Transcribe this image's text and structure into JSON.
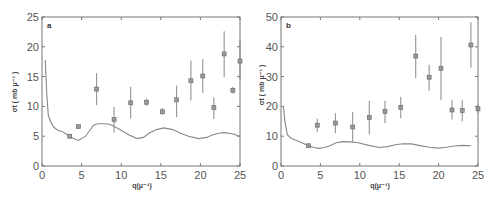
{
  "chart_data": [
    {
      "type": "scatter",
      "panel": "a",
      "title": "",
      "xlabel": "q(μ⁻¹)",
      "ylabel": "σt (mb μ⁻¹)",
      "xlim": [
        0,
        25
      ],
      "ylim": [
        0,
        25
      ],
      "xticks": [
        0,
        5,
        10,
        15,
        20,
        25
      ],
      "yticks": [
        0,
        5,
        10,
        15,
        20,
        25
      ],
      "grid": false,
      "series": [
        {
          "name": "data",
          "style": "square markers with error bars",
          "points": [
            {
              "x": 3.5,
              "y": 5.0,
              "ylo": 5.0,
              "yhi": 5.0
            },
            {
              "x": 4.6,
              "y": 6.6,
              "ylo": 6.6,
              "yhi": 6.6
            },
            {
              "x": 6.9,
              "y": 12.9,
              "ylo": 10.2,
              "yhi": 15.6
            },
            {
              "x": 9.1,
              "y": 7.8,
              "ylo": 5.6,
              "yhi": 9.9
            },
            {
              "x": 11.2,
              "y": 10.6,
              "ylo": 8.0,
              "yhi": 13.3
            },
            {
              "x": 13.2,
              "y": 10.7,
              "ylo": 10.1,
              "yhi": 11.3
            },
            {
              "x": 15.2,
              "y": 9.1,
              "ylo": 8.6,
              "yhi": 9.7
            },
            {
              "x": 17.0,
              "y": 11.1,
              "ylo": 8.2,
              "yhi": 13.5
            },
            {
              "x": 18.8,
              "y": 14.3,
              "ylo": 11.0,
              "yhi": 17.7
            },
            {
              "x": 20.3,
              "y": 15.1,
              "ylo": 12.3,
              "yhi": 17.9
            },
            {
              "x": 21.7,
              "y": 9.8,
              "ylo": 7.9,
              "yhi": 11.5
            },
            {
              "x": 23.0,
              "y": 18.8,
              "ylo": 14.9,
              "yhi": 22.6
            },
            {
              "x": 24.1,
              "y": 12.7,
              "ylo": 12.2,
              "yhi": 13.3
            },
            {
              "x": 25.0,
              "y": 17.6,
              "ylo": 14.6,
              "yhi": 21.2
            }
          ]
        },
        {
          "name": "theory",
          "style": "line",
          "x": [
            0.4,
            0.6,
            0.8,
            1.1,
            1.5,
            2.0,
            2.5,
            3.0,
            3.5,
            4.0,
            4.6,
            5.0,
            5.5,
            6.0,
            6.5,
            7.0,
            7.5,
            8.0,
            8.5,
            9.0,
            10.0,
            11.0,
            12.0,
            12.8,
            13.5,
            14.5,
            15.4,
            16.5,
            17.5,
            18.5,
            19.8,
            20.8,
            21.5,
            22.3,
            23.0,
            24.0,
            25.0
          ],
          "y": [
            17.8,
            12.0,
            8.5,
            7.4,
            6.5,
            6.0,
            5.8,
            5.4,
            5.0,
            4.6,
            4.3,
            4.6,
            5.0,
            5.9,
            6.8,
            7.1,
            7.1,
            7.1,
            7.0,
            6.7,
            6.0,
            5.2,
            4.6,
            4.8,
            5.5,
            6.1,
            6.4,
            6.1,
            5.5,
            5.0,
            4.6,
            4.8,
            5.2,
            5.5,
            5.6,
            5.4,
            5.0
          ]
        }
      ]
    },
    {
      "type": "scatter",
      "panel": "b",
      "title": "",
      "xlabel": "q(μ⁻¹)",
      "ylabel": "σt (mb μ⁻¹)",
      "xlim": [
        0,
        25
      ],
      "ylim": [
        0,
        50
      ],
      "xticks": [
        0,
        5,
        10,
        15,
        20,
        25
      ],
      "yticks": [
        0,
        10,
        20,
        30,
        40,
        50
      ],
      "grid": false,
      "series": [
        {
          "name": "data",
          "style": "square markers with error bars",
          "points": [
            {
              "x": 3.5,
              "y": 6.8,
              "ylo": 6.8,
              "yhi": 6.8
            },
            {
              "x": 4.6,
              "y": 13.7,
              "ylo": 11.5,
              "yhi": 15.9
            },
            {
              "x": 6.9,
              "y": 14.4,
              "ylo": 11.0,
              "yhi": 17.7
            },
            {
              "x": 9.1,
              "y": 13.1,
              "ylo": 8.0,
              "yhi": 18.1
            },
            {
              "x": 11.2,
              "y": 16.3,
              "ylo": 10.6,
              "yhi": 21.9
            },
            {
              "x": 13.2,
              "y": 18.3,
              "ylo": 14.4,
              "yhi": 21.9
            },
            {
              "x": 15.2,
              "y": 19.7,
              "ylo": 16.0,
              "yhi": 23.2
            },
            {
              "x": 17.1,
              "y": 36.9,
              "ylo": 29.5,
              "yhi": 44.0
            },
            {
              "x": 18.8,
              "y": 29.8,
              "ylo": 25.2,
              "yhi": 34.0
            },
            {
              "x": 20.3,
              "y": 32.8,
              "ylo": 22.1,
              "yhi": 43.3
            },
            {
              "x": 21.7,
              "y": 18.8,
              "ylo": 15.6,
              "yhi": 22.1
            },
            {
              "x": 23.0,
              "y": 18.6,
              "ylo": 15.0,
              "yhi": 22.1
            },
            {
              "x": 24.1,
              "y": 40.6,
              "ylo": 33.0,
              "yhi": 48.2
            },
            {
              "x": 25.0,
              "y": 19.2,
              "ylo": 17.8,
              "yhi": 20.5
            }
          ]
        },
        {
          "name": "theory",
          "style": "line",
          "x": [
            0.3,
            0.5,
            0.8,
            1.2,
            1.8,
            2.5,
            3.5,
            4.2,
            4.8,
            5.5,
            6.2,
            7.0,
            7.8,
            8.8,
            9.8,
            11.0,
            12.5,
            13.5,
            14.5,
            15.5,
            16.5,
            17.5,
            18.8,
            20.0,
            21.0,
            22.0,
            23.0,
            24.1
          ],
          "y": [
            20.0,
            15.0,
            10.5,
            9.5,
            8.7,
            8.0,
            6.8,
            6.2,
            5.9,
            6.2,
            6.8,
            7.8,
            8.2,
            8.1,
            7.8,
            7.0,
            6.2,
            6.5,
            7.1,
            7.5,
            7.4,
            6.9,
            6.3,
            6.0,
            6.3,
            6.7,
            6.9,
            6.8
          ]
        }
      ]
    }
  ],
  "panels": {
    "a": {
      "letter": "a",
      "xlabel": "q(μ⁻¹)",
      "ylabel": "σt ( mb  μ⁻¹ )"
    },
    "b": {
      "letter": "b",
      "xlabel": "q(μ⁻¹)",
      "ylabel": "σt ( mb  μ⁻¹ )"
    }
  }
}
